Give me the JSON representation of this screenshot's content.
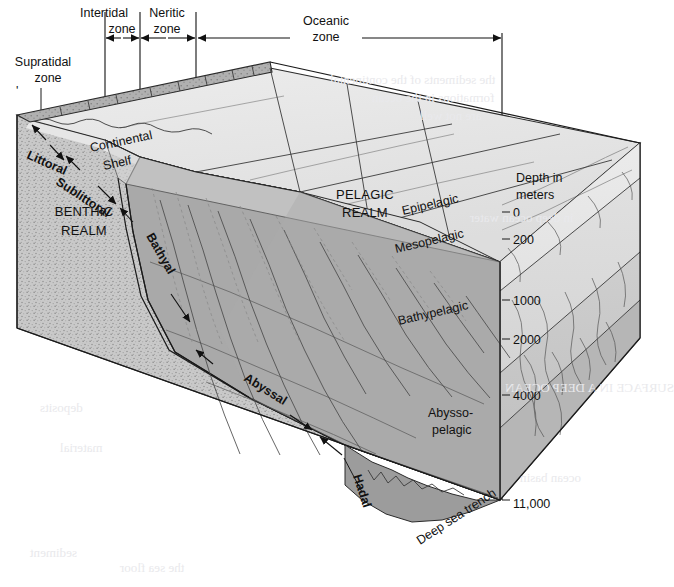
{
  "figure": {
    "surface_zones": [
      {
        "id": "supratidal",
        "label_line1": "Supratidal",
        "label_line2": "zone"
      },
      {
        "id": "intertidal",
        "label_line1": "Intertidal",
        "label_line2": "zone"
      },
      {
        "id": "neritic",
        "label_line1": "Neritic",
        "label_line2": "zone"
      },
      {
        "id": "oceanic",
        "label_line1": "Oceanic",
        "label_line2": "zone"
      }
    ],
    "realms": [
      {
        "id": "benthic",
        "label_line1": "BENTHIC",
        "label_line2": "REALM"
      },
      {
        "id": "pelagic",
        "label_line1": "PELAGIC",
        "label_line2": "REALM"
      }
    ],
    "benthic_zones": [
      {
        "id": "littoral",
        "label": "Littoral"
      },
      {
        "id": "sublittoral",
        "label": "Sublittoral"
      },
      {
        "id": "bathyal",
        "label": "Bathyal"
      },
      {
        "id": "abyssal",
        "label": "Abyssal"
      },
      {
        "id": "hadal",
        "label": "Hadal"
      }
    ],
    "pelagic_zones": [
      {
        "id": "epipelagic",
        "label": "Epipelagic"
      },
      {
        "id": "mesopelagic",
        "label": "Mesopelagic"
      },
      {
        "id": "bathypelagic",
        "label": "Bathypelagic"
      },
      {
        "id": "abyssopelagic",
        "label_line1": "Abysso-",
        "label_line2": "pelagic"
      }
    ],
    "features": [
      {
        "id": "continental-shelf",
        "label_line1": "Continental",
        "label_line2": "Shelf"
      },
      {
        "id": "deep-sea-trench",
        "label": "Deep sea trench"
      }
    ],
    "depth_scale": {
      "caption_line1": "Depth in",
      "caption_line2": "meters",
      "unit": "meters",
      "ticks": [
        "0",
        "200",
        "1000",
        "2000",
        "4000",
        "11,000"
      ]
    },
    "colors": {
      "water_shallow": "#e3e3e3",
      "water_mid": "#cfcfcf",
      "water_deep": "#b3b3b3",
      "seafloor": "#a8a8a8",
      "rock_face": "#c6c6c6",
      "ink": "#1a1a1a",
      "page": "#ffffff"
    }
  },
  "bleed_through": [
    "the sediments of the continental",
    "formations in the ocean",
    "are not well",
    "in deep ocean water",
    "SURFACE IN A DEEP OCEAN",
    "sediment",
    "the sea floor",
    "deposits",
    "material",
    "ocean basin"
  ]
}
